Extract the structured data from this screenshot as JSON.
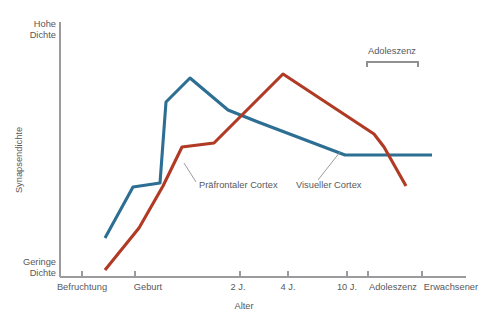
{
  "chart_data": {
    "type": "line",
    "title": "",
    "xlabel": "Alter",
    "ylabel": "Synapsendichte",
    "grid": false,
    "legend_position": "inline-labels",
    "y_axis_endpoints": {
      "high": "Hohe Dichte",
      "high_line1": "Hohe",
      "high_line2": "Dichte",
      "low": "Geringe Dichte",
      "low_line1": "Geringe",
      "low_line2": "Dichte"
    },
    "categories": [
      "Befruchtung",
      "Geburt",
      "2 J.",
      "4 J.",
      "10 J.",
      "Adoleszenz",
      "Erwachsener"
    ],
    "series": [
      {
        "name": "Visueller Cortex",
        "color": "#2d6e93",
        "values": [
          0.13,
          0.4,
          0.72,
          0.6,
          0.48,
          0.44,
          0.44
        ],
        "points": [
          {
            "x": 105,
            "y": 238
          },
          {
            "x": 133,
            "y": 187
          },
          {
            "x": 160,
            "y": 183
          },
          {
            "x": 166,
            "y": 102
          },
          {
            "x": 190,
            "y": 78
          },
          {
            "x": 228,
            "y": 110
          },
          {
            "x": 258,
            "y": 122
          },
          {
            "x": 345,
            "y": 155
          },
          {
            "x": 432,
            "y": 155
          }
        ]
      },
      {
        "name": "Präfrontaler Cortex",
        "color": "#b03a24",
        "values": [
          0.02,
          0.3,
          0.56,
          0.78,
          0.52,
          0.46,
          0.18
        ],
        "points": [
          {
            "x": 105,
            "y": 270
          },
          {
            "x": 139,
            "y": 228
          },
          {
            "x": 163,
            "y": 186
          },
          {
            "x": 182,
            "y": 147
          },
          {
            "x": 214,
            "y": 143
          },
          {
            "x": 283,
            "y": 74
          },
          {
            "x": 374,
            "y": 134
          },
          {
            "x": 384,
            "y": 147
          },
          {
            "x": 406,
            "y": 186
          }
        ]
      }
    ],
    "annotations": [
      {
        "name": "adoleszenz-bracket",
        "label": "Adoleszenz",
        "x_start": 367,
        "x_end": 418,
        "y": 62,
        "label_x": 392,
        "label_y": 54
      }
    ],
    "series_labels": [
      {
        "name": "praefrontaler-cortex-label",
        "text": "Präfrontaler Cortex",
        "text_x": 199,
        "text_y": 188,
        "leader": {
          "x1": 196,
          "y1": 182,
          "x2": 184,
          "y2": 163
        }
      },
      {
        "name": "visueller-cortex-label",
        "text": "Visueller Cortex",
        "text_x": 296,
        "text_y": 188,
        "leader": {
          "x1": 318,
          "y1": 180,
          "x2": 340,
          "y2": 152
        }
      }
    ],
    "axes": {
      "y_axis": {
        "x": 60,
        "y_top": 22,
        "y_bottom": 277
      },
      "x_axis": {
        "y": 277,
        "x_left": 60,
        "x_right": 466
      },
      "ticks": [
        {
          "label": "Befruchtung",
          "x": 82,
          "label_x": 82
        },
        {
          "label": "Geburt",
          "x": 135,
          "label_x": 148
        },
        {
          "label": "2 J.",
          "x": 240,
          "label_x": 238
        },
        {
          "label": "4 J.",
          "x": 288,
          "label_x": 288
        },
        {
          "label": "10 J.",
          "x": 347,
          "label_x": 347
        },
        {
          "label": "Adoleszenz",
          "x": 368,
          "label_x": 393
        },
        {
          "label": "Erwachsener",
          "x": 422,
          "label_x": 451
        }
      ],
      "xlabel_x": 244,
      "xlabel_y": 309,
      "ylabel_x": 22,
      "ylabel_y": 160
    },
    "colors": {
      "visueller_cortex": "#2d6e93",
      "praefrontaler_cortex": "#b03a24",
      "axis": "#9b9b9d",
      "text": "#58585a",
      "background": "#ffffff"
    }
  }
}
